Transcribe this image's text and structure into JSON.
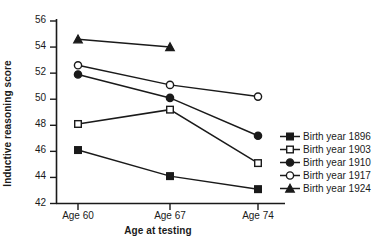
{
  "chart_data": {
    "type": "line",
    "title": "",
    "xlabel": "Age at testing",
    "ylabel": "Inductive reasoning score",
    "categories": [
      "Age 60",
      "Age 67",
      "Age 74"
    ],
    "xtick_labels": [
      "Age 60",
      "Age 67",
      "Age 74"
    ],
    "ytick_labels": [
      "56",
      "54",
      "52",
      "50",
      "48",
      "46",
      "44",
      "42"
    ],
    "yticks": [
      56,
      54,
      52,
      50,
      48,
      46,
      44,
      42
    ],
    "ylim": [
      42,
      56
    ],
    "grid": false,
    "legend_position": "right",
    "series": [
      {
        "name": "Birth year 1896",
        "marker": "filled-square",
        "color": "#1a1a1a",
        "x": [
          "Age 60",
          "Age 67",
          "Age 74"
        ],
        "values": [
          46.1,
          44.1,
          43.1
        ]
      },
      {
        "name": "Birth year 1903",
        "marker": "open-square",
        "color": "#1a1a1a",
        "x": [
          "Age 60",
          "Age 67",
          "Age 74"
        ],
        "values": [
          48.1,
          49.2,
          45.1
        ]
      },
      {
        "name": "Birth year 1910",
        "marker": "filled-circle",
        "color": "#1a1a1a",
        "x": [
          "Age 60",
          "Age 67",
          "Age 74"
        ],
        "values": [
          51.9,
          50.1,
          47.2
        ]
      },
      {
        "name": "Birth year 1917",
        "marker": "open-circle",
        "color": "#1a1a1a",
        "x": [
          "Age 60",
          "Age 67",
          "Age 74"
        ],
        "values": [
          52.6,
          51.1,
          50.2
        ]
      },
      {
        "name": "Birth year 1924",
        "marker": "filled-triangle",
        "color": "#1a1a1a",
        "x": [
          "Age 60",
          "Age 67"
        ],
        "values": [
          54.6,
          54.0
        ]
      }
    ]
  },
  "legend": {
    "items": [
      {
        "label": "Birth year 1896",
        "marker": "filled-square"
      },
      {
        "label": "Birth year 1903",
        "marker": "open-square"
      },
      {
        "label": "Birth year 1910",
        "marker": "filled-circle"
      },
      {
        "label": "Birth year 1917",
        "marker": "open-circle"
      },
      {
        "label": "Birth year 1924",
        "marker": "filled-triangle"
      }
    ]
  }
}
